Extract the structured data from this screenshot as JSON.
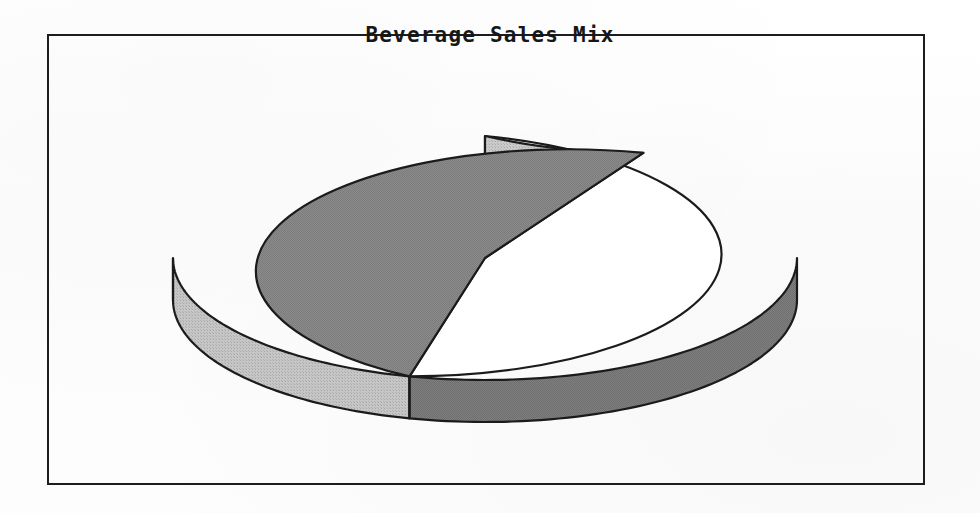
{
  "figure": {
    "title": "Beverage Sales Mix",
    "frame": {
      "border_color": "#1d1d1d"
    },
    "background_color": "#fdfdfd"
  },
  "chart_data": {
    "type": "pie",
    "title": "Beverage Sales Mix",
    "subtitle": "",
    "xlabel": "",
    "ylabel": "",
    "style": "3d-exploded-disc",
    "labels": [
      "Slice 1",
      "Slice 2",
      "Slice 3"
    ],
    "values": [
      46,
      8.5,
      45.5
    ],
    "units": "percent",
    "colors": [
      "#ffffff",
      "#c3c3c3",
      "#8c8c8c"
    ],
    "side_colors": [
      "#bdbdbd",
      "#a8a8a8",
      "#7d7d7d"
    ],
    "edge_color": "#1b1b1b",
    "legend": false,
    "legend_position": "none",
    "data_labels_shown": false,
    "start_angle_deg": 90,
    "direction": "counterclockwise",
    "boundary_angles_deg": [
      90,
      59.5,
      256
    ],
    "geometry": {
      "center_x": 485,
      "center_y": 258,
      "radius_x": 312,
      "radius_y": 122,
      "depth": 42
    },
    "slices": [
      {
        "label": "Slice 1",
        "value": 46,
        "fill": "#ffffff",
        "side_fill": "#bdbdbd",
        "start_deg": 90,
        "end_deg": 256
      },
      {
        "label": "Slice 2",
        "value": 8.5,
        "fill": "#c3c3c3",
        "side_fill": "#a8a8a8",
        "start_deg": 59.5,
        "end_deg": 90
      },
      {
        "label": "Slice 3",
        "value": 45.5,
        "fill": "#8c8c8c",
        "side_fill": "#7d7d7d",
        "start_deg": 256,
        "end_deg": 419.5
      }
    ]
  }
}
